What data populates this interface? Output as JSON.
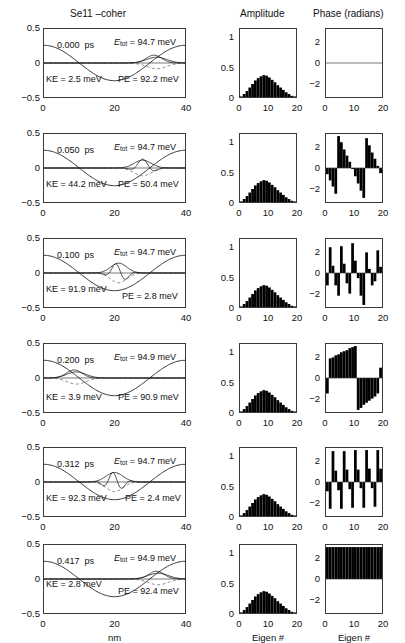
{
  "figure": {
    "titles": {
      "left": "Se11 –coher",
      "amplitude": "Amplitude",
      "phase": "Phase (radians)"
    },
    "axis_labels": {
      "left_x": "nm",
      "amplitude_x": "Eigen #",
      "phase_x": "Eigen #"
    },
    "left_yticks": [
      "0.5",
      "0",
      "−0.5"
    ],
    "left_xticks": [
      "0",
      "20",
      "40"
    ],
    "amp_yticks": [
      "1",
      "0.5",
      "0"
    ],
    "amp_xticks": [
      "0",
      "10",
      "20"
    ],
    "phase_yticks": [
      "2",
      "0",
      "−2"
    ],
    "phase_xticks": [
      "0",
      "10",
      "20"
    ],
    "units": {
      "time": "ps",
      "energy": "meV"
    },
    "labels": {
      "etot": "E",
      "etot_sub": "tot",
      "ke": "KE",
      "pe": "PE",
      "eq": "="
    }
  },
  "chart_data": {
    "type": "line",
    "title": "Se11 –coher",
    "xlabel": "nm",
    "ylabel": "",
    "xlim": [
      0,
      40
    ],
    "ylim": [
      -0.5,
      0.5
    ],
    "grid": false,
    "panels": [
      {
        "time": "0.000",
        "e_tot": "94.7",
        "ke": "2.5",
        "pe": "92.2",
        "amplitude": {
          "type": "bar",
          "xlabel": "Eigen #",
          "xlim": [
            0,
            20
          ],
          "ylim": [
            0,
            1.15
          ],
          "categories": [
            0,
            1,
            2,
            3,
            4,
            5,
            6,
            7,
            8,
            9,
            10,
            11,
            12,
            13,
            14,
            15,
            16,
            17,
            18,
            19,
            20
          ],
          "values": [
            0.01,
            0.05,
            0.1,
            0.16,
            0.22,
            0.28,
            0.32,
            0.35,
            0.37,
            0.36,
            0.33,
            0.29,
            0.25,
            0.2,
            0.16,
            0.12,
            0.08,
            0.05,
            0.02,
            0.01,
            0.0
          ]
        },
        "phase": {
          "type": "bar",
          "xlabel": "Eigen #",
          "xlim": [
            0,
            20
          ],
          "ylim": [
            -3.3,
            3.3
          ],
          "categories": [
            0,
            1,
            2,
            3,
            4,
            5,
            6,
            7,
            8,
            9,
            10,
            11,
            12,
            13,
            14,
            15,
            16,
            17,
            18,
            19,
            20
          ],
          "values": [
            0,
            0,
            0,
            0,
            0,
            0,
            0,
            0,
            0,
            0,
            0,
            0,
            0,
            0,
            0,
            0,
            0,
            0,
            0,
            0,
            0
          ]
        }
      },
      {
        "time": "0.050",
        "e_tot": "94.7",
        "ke": "44.2",
        "pe": "50.4",
        "amplitude": {
          "type": "bar",
          "xlabel": "Eigen #",
          "xlim": [
            0,
            20
          ],
          "ylim": [
            0,
            1.15
          ],
          "categories": [
            0,
            1,
            2,
            3,
            4,
            5,
            6,
            7,
            8,
            9,
            10,
            11,
            12,
            13,
            14,
            15,
            16,
            17,
            18,
            19,
            20
          ],
          "values": [
            0.01,
            0.05,
            0.1,
            0.16,
            0.22,
            0.28,
            0.32,
            0.35,
            0.37,
            0.36,
            0.33,
            0.29,
            0.25,
            0.2,
            0.16,
            0.12,
            0.08,
            0.05,
            0.02,
            0.01,
            0.0
          ]
        },
        "phase": {
          "type": "bar",
          "xlabel": "Eigen #",
          "xlim": [
            0,
            20
          ],
          "ylim": [
            -3.3,
            3.3
          ],
          "categories": [
            0,
            1,
            2,
            3,
            4,
            5,
            6,
            7,
            8,
            9,
            10,
            11,
            12,
            13,
            14,
            15,
            16,
            17,
            18,
            19,
            20
          ],
          "values": [
            -0.6,
            -1.2,
            -1.8,
            -2.5,
            3.1,
            2.5,
            1.8,
            1.2,
            0.6,
            -0.1,
            -0.8,
            -1.5,
            -2.2,
            -2.9,
            2.9,
            2.2,
            1.5,
            0.9,
            0.2,
            -0.5,
            -1.2
          ]
        }
      },
      {
        "time": "0.100",
        "e_tot": "94.7",
        "ke": "91.9",
        "pe": "2.8",
        "amplitude": {
          "type": "bar",
          "xlabel": "Eigen #",
          "xlim": [
            0,
            20
          ],
          "ylim": [
            0,
            1.15
          ],
          "categories": [
            0,
            1,
            2,
            3,
            4,
            5,
            6,
            7,
            8,
            9,
            10,
            11,
            12,
            13,
            14,
            15,
            16,
            17,
            18,
            19,
            20
          ],
          "values": [
            0.01,
            0.05,
            0.1,
            0.16,
            0.22,
            0.28,
            0.32,
            0.35,
            0.37,
            0.36,
            0.33,
            0.29,
            0.25,
            0.2,
            0.16,
            0.12,
            0.08,
            0.05,
            0.02,
            0.01,
            0.0
          ]
        },
        "phase": {
          "type": "bar",
          "xlabel": "Eigen #",
          "xlim": [
            0,
            20
          ],
          "ylim": [
            -3.3,
            3.3
          ],
          "categories": [
            0,
            1,
            2,
            3,
            4,
            5,
            6,
            7,
            8,
            9,
            10,
            11,
            12,
            13,
            14,
            15,
            16,
            17,
            18,
            19,
            20
          ],
          "values": [
            -1.2,
            2.5,
            0.7,
            -1.2,
            -2.2,
            2.6,
            0.9,
            -1.0,
            -2.0,
            2.9,
            1.2,
            -0.5,
            -2.2,
            -3.1,
            2.0,
            0.4,
            -1.2,
            -0.8,
            2.2,
            0.6,
            -2.8
          ]
        }
      },
      {
        "time": "0.200",
        "e_tot": "94.9",
        "ke": "3.9",
        "pe": "90.9",
        "amplitude": {
          "type": "bar",
          "xlabel": "Eigen #",
          "xlim": [
            0,
            20
          ],
          "ylim": [
            0,
            1.15
          ],
          "categories": [
            0,
            1,
            2,
            3,
            4,
            5,
            6,
            7,
            8,
            9,
            10,
            11,
            12,
            13,
            14,
            15,
            16,
            17,
            18,
            19,
            20
          ],
          "values": [
            0.01,
            0.05,
            0.1,
            0.16,
            0.22,
            0.28,
            0.32,
            0.35,
            0.37,
            0.36,
            0.33,
            0.29,
            0.25,
            0.2,
            0.16,
            0.12,
            0.08,
            0.05,
            0.02,
            0.01,
            0.0
          ]
        },
        "phase": {
          "type": "bar",
          "xlabel": "Eigen #",
          "xlim": [
            0,
            20
          ],
          "ylim": [
            -3.3,
            3.3
          ],
          "categories": [
            0,
            1,
            2,
            3,
            4,
            5,
            6,
            7,
            8,
            9,
            10,
            11,
            12,
            13,
            14,
            15,
            16,
            17,
            18,
            19,
            20
          ],
          "values": [
            -1.5,
            1.9,
            2.0,
            2.2,
            2.3,
            2.5,
            2.6,
            2.7,
            2.9,
            3.0,
            3.1,
            -3.1,
            -2.9,
            -2.6,
            -2.4,
            -2.2,
            -2.0,
            -1.8,
            -1.5,
            1.0,
            1.2
          ]
        }
      },
      {
        "time": "0.312",
        "e_tot": "94.7",
        "ke": "92.3",
        "pe": "2.4",
        "amplitude": {
          "type": "bar",
          "xlabel": "Eigen #",
          "xlim": [
            0,
            20
          ],
          "ylim": [
            0,
            1.15
          ],
          "categories": [
            0,
            1,
            2,
            3,
            4,
            5,
            6,
            7,
            8,
            9,
            10,
            11,
            12,
            13,
            14,
            15,
            16,
            17,
            18,
            19,
            20
          ],
          "values": [
            0.01,
            0.05,
            0.1,
            0.16,
            0.22,
            0.28,
            0.32,
            0.35,
            0.37,
            0.36,
            0.33,
            0.29,
            0.25,
            0.2,
            0.16,
            0.12,
            0.08,
            0.05,
            0.02,
            0.01,
            0.0
          ]
        },
        "phase": {
          "type": "bar",
          "xlabel": "Eigen #",
          "xlim": [
            0,
            20
          ],
          "ylim": [
            -3.3,
            3.3
          ],
          "categories": [
            0,
            1,
            2,
            3,
            4,
            5,
            6,
            7,
            8,
            9,
            10,
            11,
            12,
            13,
            14,
            15,
            16,
            17,
            18,
            19,
            20
          ],
          "values": [
            -0.9,
            -2.6,
            3.0,
            1.1,
            -0.8,
            -2.6,
            3.0,
            1.2,
            -0.7,
            -2.5,
            3.1,
            1.2,
            -0.6,
            -2.5,
            3.1,
            1.3,
            -0.6,
            -2.4,
            3.1,
            1.3,
            -0.5
          ]
        }
      },
      {
        "time": "0.417",
        "e_tot": "94.9",
        "ke": "2.8",
        "pe": "92.4",
        "amplitude": {
          "type": "bar",
          "xlabel": "Eigen #",
          "xlim": [
            0,
            20
          ],
          "ylim": [
            0,
            1.15
          ],
          "categories": [
            0,
            1,
            2,
            3,
            4,
            5,
            6,
            7,
            8,
            9,
            10,
            11,
            12,
            13,
            14,
            15,
            16,
            17,
            18,
            19,
            20
          ],
          "values": [
            0.01,
            0.05,
            0.1,
            0.16,
            0.22,
            0.28,
            0.32,
            0.35,
            0.37,
            0.36,
            0.33,
            0.29,
            0.25,
            0.2,
            0.16,
            0.12,
            0.08,
            0.05,
            0.02,
            0.01,
            0.0
          ]
        },
        "phase": {
          "type": "bar",
          "xlabel": "Eigen #",
          "xlim": [
            0,
            20
          ],
          "ylim": [
            -3.3,
            3.3
          ],
          "categories": [
            0,
            1,
            2,
            3,
            4,
            5,
            6,
            7,
            8,
            9,
            10,
            11,
            12,
            13,
            14,
            15,
            16,
            17,
            18,
            19,
            20
          ],
          "values": [
            3.1,
            3.1,
            3.1,
            3.1,
            3.1,
            3.1,
            3.1,
            3.1,
            3.1,
            3.1,
            3.1,
            3.1,
            3.1,
            3.1,
            3.1,
            3.1,
            3.1,
            3.1,
            3.1,
            3.1,
            3.1
          ]
        }
      }
    ]
  }
}
